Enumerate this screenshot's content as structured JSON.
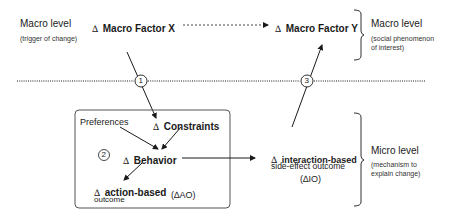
{
  "macro_left": {
    "label": "Macro level",
    "sub": "(trigger of change)"
  },
  "macro_factor_x": {
    "delta": "∆",
    "label": "Macro Factor X"
  },
  "macro_factor_y": {
    "delta": "∆",
    "label": "Macro Factor Y"
  },
  "macro_right": {
    "label": "Macro level",
    "sub_line1": "(social phenomenon",
    "sub_line2": "of interest)"
  },
  "micro_right": {
    "label": "Micro level",
    "sub_line1": "(mechanism to",
    "sub_line2": "explain change)"
  },
  "box": {
    "preferences": "Preferences",
    "constraints": {
      "delta": "∆",
      "label": "Constraints"
    },
    "behavior": {
      "delta": "∆",
      "label": "Behavior"
    },
    "action_outcome": {
      "delta": "∆",
      "label": "action-based",
      "abbr": "(∆AO)",
      "line2": "outcome"
    },
    "step_marker": "2"
  },
  "interaction_outcome": {
    "delta": "∆",
    "label": "interaction-based",
    "line2": "side-effect outcome",
    "abbr": "(∆IO)"
  },
  "step_markers": [
    "1",
    "2",
    "3"
  ],
  "colors": {
    "ink": "#1a1a1a",
    "box_border": "#555555"
  }
}
